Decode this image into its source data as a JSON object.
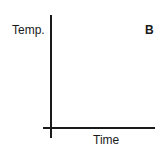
{
  "chart_data": {
    "type": "line",
    "title": "",
    "panel_label": "B",
    "xlabel": "Time",
    "ylabel": "Temp.",
    "series": [],
    "x_ticks": [],
    "y_ticks": [],
    "grid": false,
    "legend": null
  }
}
